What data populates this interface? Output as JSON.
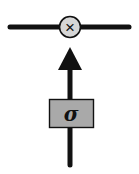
{
  "diagram": {
    "gate_operator": {
      "symbol": "×",
      "shape": "circle",
      "fill": "#d6d6d6"
    },
    "activation_box": {
      "label": "σ",
      "fill": "#a9a9a9"
    },
    "colors": {
      "line": "#111111",
      "background": "#ffffff"
    }
  }
}
